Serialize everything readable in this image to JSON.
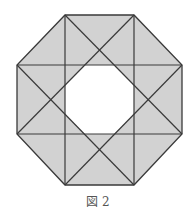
{
  "caption": "図 2",
  "colors": {
    "fill": "#d2d2d2",
    "hole": "#ffffff",
    "stroke": "#3a3a3a"
  },
  "outer_octagon": [
    [
      65,
      15
    ],
    [
      134,
      15
    ],
    [
      182,
      65
    ],
    [
      182,
      134
    ],
    [
      134,
      185
    ],
    [
      65,
      185
    ],
    [
      17,
      134
    ],
    [
      17,
      65
    ]
  ],
  "lines": [
    [
      65,
      15,
      65,
      185
    ],
    [
      134,
      15,
      134,
      185
    ],
    [
      17,
      65,
      182,
      65
    ],
    [
      17,
      134,
      182,
      134
    ],
    [
      65,
      15,
      182,
      134
    ],
    [
      134,
      15,
      17,
      134
    ],
    [
      182,
      65,
      65,
      185
    ],
    [
      17,
      65,
      134,
      185
    ]
  ]
}
